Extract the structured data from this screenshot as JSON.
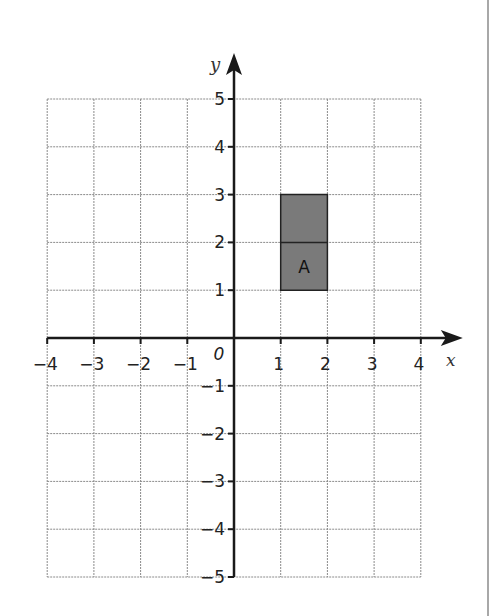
{
  "chart_data": {
    "type": "coordinate-grid",
    "title": "",
    "xlabel": "x",
    "ylabel": "y",
    "xlim": [
      -4,
      4
    ],
    "ylim": [
      -5,
      5
    ],
    "grid": true,
    "origin_label": "0",
    "x_ticks": [
      -4,
      -3,
      -2,
      -1,
      1,
      2,
      3,
      4
    ],
    "x_tick_labels": [
      "−4",
      "−3",
      "−2",
      "−1",
      "1",
      "2",
      "3",
      "4"
    ],
    "y_ticks": [
      5,
      4,
      3,
      2,
      1,
      -1,
      -2,
      -3,
      -4,
      -5
    ],
    "y_tick_labels": [
      "5",
      "4",
      "3",
      "2",
      "1",
      "−1",
      "−2",
      "−3",
      "−4",
      "−5"
    ],
    "shapes": [
      {
        "label": "A",
        "type": "rectangle",
        "vertices": [
          [
            1,
            1
          ],
          [
            2,
            1
          ],
          [
            2,
            3
          ],
          [
            1,
            3
          ]
        ],
        "fill": "#7a7a7a",
        "inner_lines": [
          [
            [
              1,
              2
            ],
            [
              2,
              2
            ]
          ]
        ]
      }
    ]
  },
  "colors": {
    "grid": "#8a8a8a",
    "axis": "#1a1a1a",
    "shape_fill": "#7a7a7a",
    "border": "#a8a8a8"
  },
  "layout": {
    "x0_px": 234,
    "unit_x_px": 46.7,
    "y0_px": 338,
    "unit_y_px": 47.8
  }
}
